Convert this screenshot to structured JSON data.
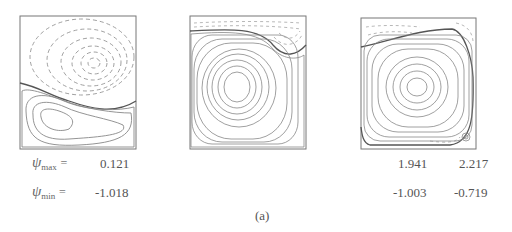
{
  "figure": {
    "caption": "(a)",
    "panels": [
      {
        "id": "panel-1",
        "description": "streamline contours: dashed upper vortex, solid lower vortex"
      },
      {
        "id": "panel-2",
        "description": "streamline contours: large solid central vortex, dashed thin top region"
      },
      {
        "id": "panel-3",
        "description": "streamline contours: large solid central vortex, dashed top-left and corner regions"
      }
    ]
  },
  "labels": {
    "psi_max_symbol": "ψ",
    "psi_max_sub": "max",
    "psi_min_symbol": "ψ",
    "psi_min_sub": "min",
    "equals": "="
  },
  "values": {
    "col1_max": "0.121",
    "col1_min": "-1.018",
    "col3a_max": "1.941",
    "col3a_min": "-1.003",
    "col3b_max": "2.217",
    "col3b_min": "-0.719"
  }
}
